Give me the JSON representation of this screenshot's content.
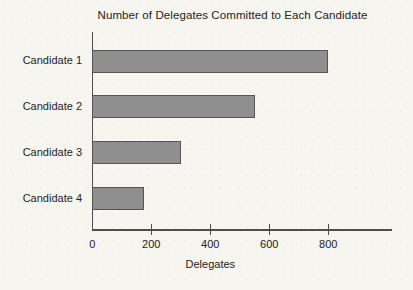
{
  "page": {
    "background_color": "#f7f5f0",
    "text_color": "#222222"
  },
  "chart_data": {
    "type": "bar",
    "orientation": "horizontal",
    "title": "Number of Delegates Committed to Each Candidate",
    "categories": [
      "Candidate 1",
      "Candidate 2",
      "Candidate 3",
      "Candidate 4"
    ],
    "values": [
      800,
      550,
      300,
      175
    ],
    "xlabel": "Delegates",
    "ylabel": "",
    "x_ticks": [
      0,
      200,
      400,
      600,
      800
    ],
    "xlim": [
      0,
      1020
    ],
    "grid": false,
    "legend": false,
    "bar_color": "#8f8f8f",
    "bar_border_color": "#555555",
    "axis_color": "#4d4d4d"
  }
}
